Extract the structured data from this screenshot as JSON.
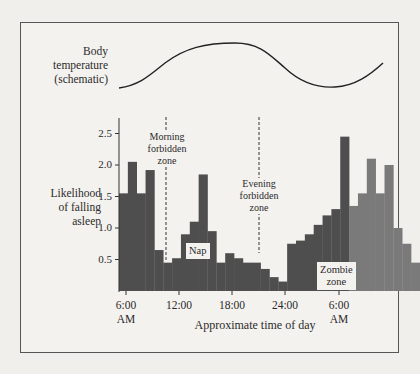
{
  "labels": {
    "temp_line1": "Body",
    "temp_line2": "temperature",
    "temp_line3": "(schematic)",
    "ylabel_line1": "Likelihood",
    "ylabel_line2": "of falling",
    "ylabel_line3": "asleep",
    "xlabel": "Approximate time of day",
    "morning_1": "Morning",
    "morning_2": "forbidden",
    "morning_3": "zone",
    "evening_1": "Evening",
    "evening_2": "forbidden",
    "evening_3": "zone",
    "nap": "Nap",
    "zombie_1": "Zombie",
    "zombie_2": "zone"
  },
  "yticks": [
    "2.5",
    "2.0",
    "1.5",
    "1.0",
    "0.5"
  ],
  "xticks": [
    {
      "line1": "6:00",
      "line2": "AM"
    },
    {
      "line1": "12:00",
      "line2": ""
    },
    {
      "line1": "18:00",
      "line2": ""
    },
    {
      "line1": "24:00",
      "line2": ""
    },
    {
      "line1": "6:00",
      "line2": "AM"
    }
  ],
  "colors": {
    "bar_dark": "#4e4e4e",
    "bar_zombie": "#7a7a7a",
    "background": "#f4f2ef"
  },
  "chart_data": {
    "type": "bar",
    "title": "",
    "xlabel": "Approximate time of day",
    "ylabel": "Likelihood of falling asleep",
    "ylim": [
      0,
      2.7
    ],
    "x_tick_labels": [
      "6:00 AM",
      "12:00",
      "18:00",
      "24:00",
      "6:00 AM"
    ],
    "y_tick_labels": [
      "0.5",
      "1.0",
      "1.5",
      "2.0",
      "2.5"
    ],
    "bar_width_hours": 1,
    "start_hour": 5.3,
    "values": [
      1.55,
      2.05,
      1.55,
      1.92,
      0.65,
      0.45,
      0.52,
      0.9,
      1.1,
      1.85,
      0.95,
      0.45,
      0.6,
      0.52,
      0.45,
      0.45,
      0.35,
      0.22,
      0.15,
      0.75,
      0.8,
      0.9,
      1.05,
      1.2,
      1.3,
      2.45,
      1.35,
      1.55,
      2.1,
      1.55,
      2.0,
      1.0,
      0.75,
      0.45
    ],
    "zombie_zone_start_index": 26,
    "annotations": [
      {
        "text": "Morning forbidden zone",
        "x_hour": 10.5,
        "style": "dashed vertical line"
      },
      {
        "text": "Evening forbidden zone",
        "x_hour": 21.0,
        "style": "dashed vertical line"
      },
      {
        "text": "Nap",
        "x_hour": 14.5
      },
      {
        "text": "Zombie zone",
        "x_hour": 31.5
      }
    ],
    "temperature_curve": {
      "label": "Body temperature (schematic)",
      "shape": "sinusoid: low at ~6AM, peak ~17:00, low ~4AM next day"
    },
    "grid": false,
    "legend": null
  }
}
